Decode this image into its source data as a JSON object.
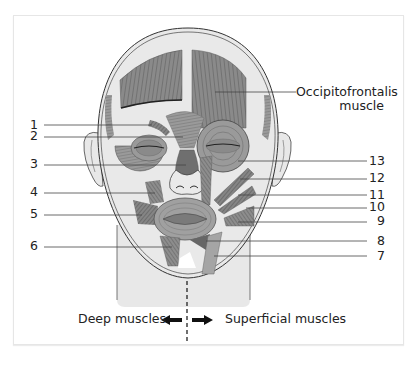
{
  "figure": {
    "named_label": {
      "line1": "Occipitofrontalis",
      "line2": "muscle"
    },
    "left_labels": [
      {
        "number": "1",
        "y": 125
      },
      {
        "number": "2",
        "y": 136
      },
      {
        "number": "3",
        "y": 164
      },
      {
        "number": "4",
        "y": 192
      },
      {
        "number": "5",
        "y": 214
      },
      {
        "number": "6",
        "y": 246
      }
    ],
    "right_labels": [
      {
        "number": "13",
        "y": 161
      },
      {
        "number": "12",
        "y": 178
      },
      {
        "number": "11",
        "y": 195
      },
      {
        "number": "10",
        "y": 207
      },
      {
        "number": "9",
        "y": 221
      },
      {
        "number": "8",
        "y": 241
      },
      {
        "number": "7",
        "y": 256
      }
    ],
    "captions": {
      "left": "Deep muscles",
      "right": "Superficial muscles"
    },
    "colors": {
      "muscle": "#7a7a7a",
      "muscle_dark": "#555555",
      "skin": "#e9e9e9",
      "outline": "#333333",
      "leader": "#444444"
    }
  }
}
